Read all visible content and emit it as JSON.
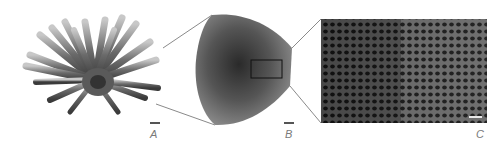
{
  "figure": {
    "panels": [
      {
        "id": "A",
        "label": "A",
        "description": "whole sea urchin with spines"
      },
      {
        "id": "B",
        "label": "B",
        "description": "cross-section of spine"
      },
      {
        "id": "C",
        "label": "C",
        "description": "magnified porous stereom microstructure"
      }
    ],
    "colors": {
      "background": "#ffffff",
      "connector_line": "#8a8a8a",
      "label_text": "#7a7a7a",
      "scalebar": "#555555"
    }
  }
}
